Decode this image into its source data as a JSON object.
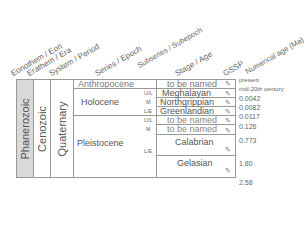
{
  "headers": [
    "Eonothem / Eon",
    "Erathem / Era",
    "System / Period",
    "Series / Epoch",
    "Subseries / Subepoch",
    "Stage / Age",
    "GSSP",
    "Numerical age (Ma)"
  ],
  "eon": "Phanerozoic",
  "era": "Cenozoic",
  "period": "Quaternary",
  "series": {
    "anthropocene": "Anthropocene",
    "holocene": "Holocene",
    "pleistocene": "Pleistocene"
  },
  "subseries": {
    "ul": "U/L",
    "m": "M",
    "le": "L/E"
  },
  "stages": {
    "anthro": "to be named",
    "meghalayan": "Meghalayan",
    "northgrippian": "Northgrippian",
    "greenlandian": "Greenlandian",
    "pl_upper": "to be named",
    "pl_middle": "to be named",
    "calabrian": "Calabrian",
    "gelasian": "Gelasian"
  },
  "ages": [
    "present",
    "mid-20th century",
    "0.0042",
    "0.0082",
    "0.0117",
    "0.126",
    "0.773",
    "1.80",
    "2.58"
  ],
  "colors": {
    "eon_fill": "#d9d9d9",
    "border": "#999999"
  }
}
